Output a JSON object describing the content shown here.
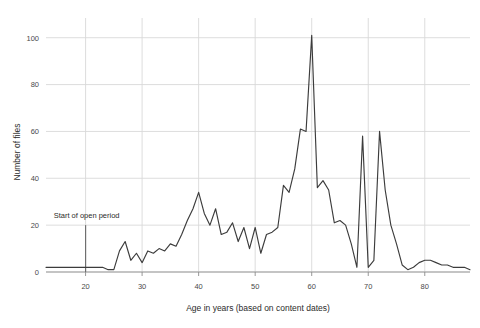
{
  "chart_data": {
    "type": "line",
    "title": "",
    "xlabel": "Age in years (based on content dates)",
    "ylabel": "Number of files",
    "xlim": [
      13,
      88
    ],
    "ylim": [
      0,
      105
    ],
    "grid": true,
    "legend": false,
    "legend_position": "none",
    "xticks": [
      20,
      30,
      40,
      50,
      60,
      70,
      80
    ],
    "yticks": [
      0,
      20,
      40,
      60,
      80,
      100
    ],
    "line_color": "#3c3c3c",
    "grid_color": "#d9d9d9",
    "axis_color": "#8c8c8c",
    "annotations": [
      {
        "text": "Start of open period",
        "x": 20,
        "y": 22,
        "marker": "vertical-line",
        "marker_from_y": 0,
        "marker_to_y": 20
      }
    ],
    "x": [
      13,
      14,
      15,
      16,
      17,
      18,
      19,
      20,
      21,
      22,
      23,
      24,
      25,
      26,
      27,
      28,
      29,
      30,
      31,
      32,
      33,
      34,
      35,
      36,
      37,
      38,
      39,
      40,
      41,
      42,
      43,
      44,
      45,
      46,
      47,
      48,
      49,
      50,
      51,
      52,
      53,
      54,
      55,
      56,
      57,
      58,
      59,
      60,
      61,
      62,
      63,
      64,
      65,
      66,
      67,
      68,
      69,
      70,
      71,
      72,
      73,
      74,
      75,
      76,
      77,
      78,
      79,
      80,
      81,
      82,
      83,
      84,
      85,
      86,
      87,
      88
    ],
    "values": [
      2,
      2,
      2,
      2,
      2,
      2,
      2,
      2,
      2,
      2,
      2,
      1,
      1,
      9,
      13,
      5,
      8,
      4,
      9,
      8,
      10,
      9,
      12,
      11,
      16,
      22,
      27,
      34,
      25,
      20,
      27,
      16,
      17,
      21,
      13,
      19,
      10,
      19,
      8,
      16,
      17,
      19,
      37,
      34,
      44,
      61,
      60,
      101,
      36,
      39,
      35,
      21,
      22,
      20,
      12,
      2,
      58,
      2,
      5,
      60,
      35,
      20,
      12,
      3,
      1,
      2,
      4,
      5,
      5,
      4,
      3,
      3,
      2,
      2,
      2,
      1
    ],
    "series": [
      {
        "name": "Number of files",
        "values": [
          2,
          2,
          2,
          2,
          2,
          2,
          2,
          2,
          2,
          2,
          2,
          1,
          1,
          9,
          13,
          5,
          8,
          4,
          9,
          8,
          10,
          9,
          12,
          11,
          16,
          22,
          27,
          34,
          25,
          20,
          27,
          16,
          17,
          21,
          13,
          19,
          10,
          19,
          8,
          16,
          17,
          19,
          37,
          34,
          44,
          61,
          60,
          101,
          36,
          39,
          35,
          21,
          22,
          20,
          12,
          2,
          58,
          2,
          5,
          60,
          35,
          20,
          12,
          3,
          1,
          2,
          4,
          5,
          5,
          4,
          3,
          3,
          2,
          2,
          2,
          1
        ]
      }
    ]
  }
}
